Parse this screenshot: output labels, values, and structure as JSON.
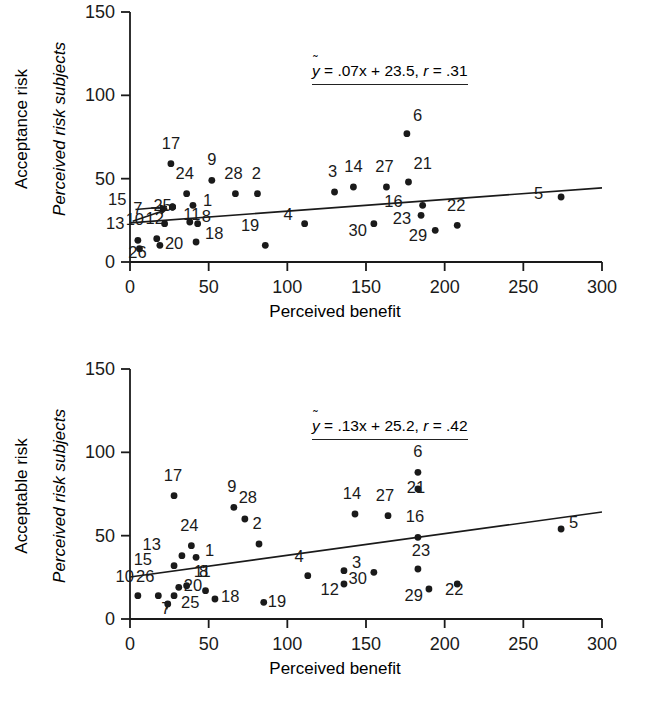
{
  "figure": {
    "panels": [
      {
        "id": "top",
        "y_axis_outer_title": "Acceptance risk",
        "y_axis_inner_title": "Perceived risk subjects",
        "x_axis_title": "Perceived benefit",
        "equation": {
          "yhat": "y",
          "text": " = .07x + 23.5, ",
          "r_symbol": "r",
          "r_text": " = .31"
        }
      },
      {
        "id": "bottom",
        "y_axis_outer_title": "Acceptable risk",
        "y_axis_inner_title": "Perceived risk subjects",
        "x_axis_title": "Perceived benefit",
        "equation": {
          "yhat": "y",
          "text": " = .13x + 25.2, ",
          "r_symbol": "r",
          "r_text": " = .42"
        }
      }
    ]
  },
  "chart_data": [
    {
      "type": "scatter",
      "title": "Acceptance risk",
      "xlabel": "Perceived benefit",
      "ylabel": "Perceived risk subjects",
      "xlim": [
        0,
        300
      ],
      "ylim": [
        0,
        150
      ],
      "xticks": [
        0,
        50,
        100,
        150,
        200,
        250,
        300
      ],
      "yticks": [
        0,
        50,
        100,
        150
      ],
      "grid": false,
      "legend": null,
      "annotation": "ŷ = .07x + 23.5, r = .31",
      "fit": {
        "slope": 0.07,
        "intercept": 23.5,
        "r": 0.31,
        "x_range": [
          0,
          300
        ]
      },
      "points": [
        {
          "label": "1",
          "x": 40,
          "y": 34,
          "lx": 10,
          "ly": 1
        },
        {
          "label": "2",
          "x": 81,
          "y": 41,
          "lx": -1,
          "ly": -15
        },
        {
          "label": "3",
          "x": 130,
          "y": 42,
          "lx": -2,
          "ly": -15
        },
        {
          "label": "4",
          "x": 111,
          "y": 23,
          "lx": -12,
          "ly": -4
        },
        {
          "label": "5",
          "x": 274,
          "y": 39,
          "lx": -18,
          "ly": 2
        },
        {
          "label": "6",
          "x": 176,
          "y": 77,
          "lx": 6,
          "ly": -13
        },
        {
          "label": "7",
          "x": 27,
          "y": 33,
          "lx": -30,
          "ly": 7,
          "arrow": true
        },
        {
          "label": "8",
          "x": 43,
          "y": 23,
          "lx": 4,
          "ly": -2
        },
        {
          "label": "9",
          "x": 52,
          "y": 49,
          "lx": 0,
          "ly": -15
        },
        {
          "label": "10",
          "x": 5,
          "y": 13,
          "lx": -3,
          "ly": -15
        },
        {
          "label": "11",
          "x": 38,
          "y": 24,
          "lx": 2,
          "ly": -2
        },
        {
          "label": "12",
          "x": 17,
          "y": 14,
          "lx": -2,
          "ly": -15
        },
        {
          "label": "13",
          "x": 27,
          "y": 33,
          "lx": -48,
          "ly": 22,
          "arrow": true
        },
        {
          "label": "14",
          "x": 142,
          "y": 45,
          "lx": 0,
          "ly": -15
        },
        {
          "label": "15",
          "x": 27,
          "y": 33,
          "lx": -46,
          "ly": -2,
          "arrow": true
        },
        {
          "label": "16",
          "x": 186,
          "y": 34,
          "lx": -20,
          "ly": 2
        },
        {
          "label": "17",
          "x": 26,
          "y": 59,
          "lx": 0,
          "ly": -15
        },
        {
          "label": "18",
          "x": 42,
          "y": 12,
          "lx": 9,
          "ly": -3
        },
        {
          "label": "19",
          "x": 86,
          "y": 10,
          "lx": -6,
          "ly": -14
        },
        {
          "label": "20",
          "x": 19,
          "y": 10,
          "lx": 5,
          "ly": 4
        },
        {
          "label": "21",
          "x": 177,
          "y": 48,
          "lx": 5,
          "ly": -13
        },
        {
          "label": "22",
          "x": 208,
          "y": 22,
          "lx": -1,
          "ly": -14
        },
        {
          "label": "23",
          "x": 185,
          "y": 28,
          "lx": -10,
          "ly": 9
        },
        {
          "label": "24",
          "x": 36,
          "y": 41,
          "lx": -2,
          "ly": -15
        },
        {
          "label": "25",
          "x": 22,
          "y": 23,
          "lx": -2,
          "ly": -13
        },
        {
          "label": "26",
          "x": 6,
          "y": 8,
          "lx": -2,
          "ly": 9
        },
        {
          "label": "27",
          "x": 163,
          "y": 45,
          "lx": -2,
          "ly": -15
        },
        {
          "label": "28",
          "x": 67,
          "y": 41,
          "lx": -2,
          "ly": -15
        },
        {
          "label": "29",
          "x": 194,
          "y": 19,
          "lx": -8,
          "ly": 11
        },
        {
          "label": "30",
          "x": 155,
          "y": 23,
          "lx": -7,
          "ly": 12
        }
      ]
    },
    {
      "type": "scatter",
      "title": "Acceptable risk",
      "xlabel": "Perceived benefit",
      "ylabel": "Perceived risk subjects",
      "xlim": [
        0,
        300
      ],
      "ylim": [
        0,
        150
      ],
      "xticks": [
        0,
        50,
        100,
        150,
        200,
        250,
        300
      ],
      "yticks": [
        0,
        50,
        100,
        150
      ],
      "grid": false,
      "legend": null,
      "annotation": "ŷ = .13x + 25.2, r = .42",
      "fit": {
        "slope": 0.13,
        "intercept": 25.2,
        "r": 0.42,
        "x_range": [
          0,
          300
        ]
      },
      "points": [
        {
          "label": "1",
          "x": 42,
          "y": 37,
          "lx": 9,
          "ly": -1
        },
        {
          "label": "2",
          "x": 82,
          "y": 45,
          "lx": -2,
          "ly": -15
        },
        {
          "label": "3",
          "x": 136,
          "y": 29,
          "lx": 8,
          "ly": -3
        },
        {
          "label": "4",
          "x": 113,
          "y": 26,
          "lx": -4,
          "ly": -14
        },
        {
          "label": "5",
          "x": 274,
          "y": 54,
          "lx": 8,
          "ly": -1
        },
        {
          "label": "6",
          "x": 183,
          "y": 88,
          "lx": 0,
          "ly": -15
        },
        {
          "label": "7",
          "x": 24,
          "y": 9,
          "lx": -2,
          "ly": 10,
          "arrow": true
        },
        {
          "label": "8",
          "x": 48,
          "y": 17,
          "lx": -2,
          "ly": -14
        },
        {
          "label": "9",
          "x": 66,
          "y": 67,
          "lx": -2,
          "ly": -15
        },
        {
          "label": "10",
          "x": 5,
          "y": 14,
          "lx": -4,
          "ly": -14
        },
        {
          "label": "11",
          "x": 36,
          "y": 20,
          "lx": 7,
          "ly": -9
        },
        {
          "label": "12",
          "x": 136,
          "y": 21,
          "lx": -5,
          "ly": 11
        },
        {
          "label": "13",
          "x": 33,
          "y": 38,
          "lx": -21,
          "ly": -6
        },
        {
          "label": "14",
          "x": 143,
          "y": 63,
          "lx": -3,
          "ly": -15
        },
        {
          "label": "15",
          "x": 28,
          "y": 32,
          "lx": -22,
          "ly": -1
        },
        {
          "label": "16",
          "x": 183,
          "y": 49,
          "lx": -3,
          "ly": -15
        },
        {
          "label": "17",
          "x": 28,
          "y": 74,
          "lx": -1,
          "ly": -15
        },
        {
          "label": "18",
          "x": 54,
          "y": 12,
          "lx": 6,
          "ly": 3
        },
        {
          "label": "19",
          "x": 85,
          "y": 10,
          "lx": 4,
          "ly": 5
        },
        {
          "label": "20",
          "x": 31,
          "y": 19,
          "lx": 5,
          "ly": 4
        },
        {
          "label": "21",
          "x": 183,
          "y": 78,
          "lx": -2,
          "ly": 4
        },
        {
          "label": "22",
          "x": 208,
          "y": 21,
          "lx": -3,
          "ly": 11
        },
        {
          "label": "23",
          "x": 183,
          "y": 30,
          "lx": 3,
          "ly": -13
        },
        {
          "label": "24",
          "x": 39,
          "y": 44,
          "lx": -2,
          "ly": -15
        },
        {
          "label": "25",
          "x": 28,
          "y": 14,
          "lx": 7,
          "ly": 12
        },
        {
          "label": "26",
          "x": 18,
          "y": 14,
          "lx": -4,
          "ly": -14
        },
        {
          "label": "27",
          "x": 164,
          "y": 62,
          "lx": -3,
          "ly": -15
        },
        {
          "label": "28",
          "x": 73,
          "y": 60,
          "lx": 3,
          "ly": -16
        },
        {
          "label": "29",
          "x": 190,
          "y": 18,
          "lx": -6,
          "ly": 12
        },
        {
          "label": "30",
          "x": 155,
          "y": 28,
          "lx": -7,
          "ly": 12
        }
      ]
    }
  ]
}
